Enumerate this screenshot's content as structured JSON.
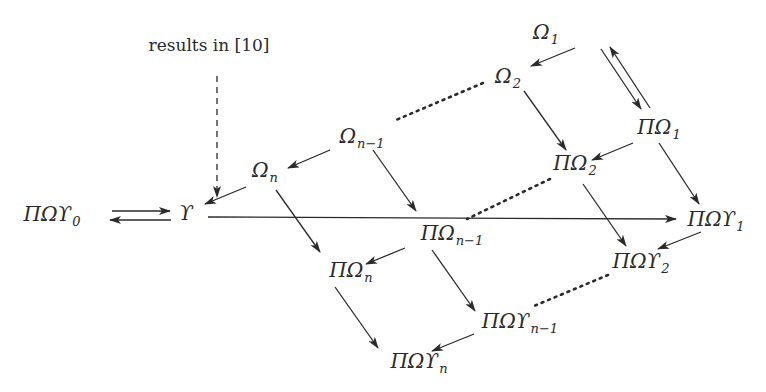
{
  "annotation": {
    "text": "results in [10]"
  },
  "nodes": {
    "omega1": {
      "base": "Ω",
      "sub": "1"
    },
    "omega2": {
      "base": "Ω",
      "sub": "2"
    },
    "omega_n_minus_1": {
      "base": "Ω",
      "sub": "n−1"
    },
    "omega_n": {
      "base": "Ω",
      "sub": "n"
    },
    "pi_omega1": {
      "base": "ΠΩ",
      "sub": "1"
    },
    "pi_omega2": {
      "base": "ΠΩ",
      "sub": "2"
    },
    "pi_omega_n_minus_1": {
      "base": "ΠΩ",
      "sub": "n−1"
    },
    "pi_omega_n": {
      "base": "ΠΩ",
      "sub": "n"
    },
    "pi_omega_upsilon0": {
      "base": "ΠΩϒ",
      "sub": "0"
    },
    "upsilon": {
      "base": "ϒ",
      "sub": ""
    },
    "pi_omega_upsilon1": {
      "base": "ΠΩϒ",
      "sub": "1"
    },
    "pi_omega_upsilon2": {
      "base": "ΠΩϒ",
      "sub": "2"
    },
    "pi_omega_upsilon_n_minus_1": {
      "base": "ΠΩϒ",
      "sub": "n−1"
    },
    "pi_omega_upsilon_n": {
      "base": "ΠΩϒ",
      "sub": "n"
    }
  },
  "edges": [
    {
      "from": "Ω1",
      "to": "Ω2",
      "style": "solid"
    },
    {
      "from": "Ω1",
      "to": "ΠΩ1",
      "style": "solid"
    },
    {
      "from": "ΠΩ1",
      "to": "Ω1",
      "style": "solid"
    },
    {
      "from": "Ω2",
      "to": "Ωn−1",
      "style": "dotted"
    },
    {
      "from": "Ω2",
      "to": "ΠΩ2",
      "style": "solid"
    },
    {
      "from": "Ωn−1",
      "to": "Ωn",
      "style": "solid"
    },
    {
      "from": "Ωn−1",
      "to": "ΠΩn−1",
      "style": "solid"
    },
    {
      "from": "Ωn",
      "to": "ϒ",
      "style": "solid"
    },
    {
      "from": "Ωn",
      "to": "ΠΩn",
      "style": "solid"
    },
    {
      "from": "ΠΩ1",
      "to": "ΠΩ2",
      "style": "solid"
    },
    {
      "from": "ΠΩ1",
      "to": "ΠΩϒ1",
      "style": "solid"
    },
    {
      "from": "ΠΩ2",
      "to": "ΠΩn−1",
      "style": "dotted"
    },
    {
      "from": "ΠΩ2",
      "to": "ΠΩϒ2",
      "style": "solid"
    },
    {
      "from": "ΠΩn−1",
      "to": "ΠΩn",
      "style": "solid"
    },
    {
      "from": "ΠΩn−1",
      "to": "ΠΩϒn−1",
      "style": "solid"
    },
    {
      "from": "ΠΩn",
      "to": "ΠΩϒn",
      "style": "solid"
    },
    {
      "from": "ΠΩϒ1",
      "to": "ΠΩϒ2",
      "style": "solid"
    },
    {
      "from": "ΠΩϒ2",
      "to": "ΠΩϒn−1",
      "style": "dotted"
    },
    {
      "from": "ΠΩϒn−1",
      "to": "ΠΩϒn",
      "style": "solid"
    },
    {
      "from": "ΠΩϒ0",
      "to": "ϒ",
      "style": "solid"
    },
    {
      "from": "ϒ",
      "to": "ΠΩϒ0",
      "style": "solid"
    },
    {
      "from": "ϒ",
      "to": "ΠΩϒ1",
      "style": "solid"
    },
    {
      "from": "results in [10]",
      "to": "ϒ",
      "style": "dashed"
    }
  ]
}
